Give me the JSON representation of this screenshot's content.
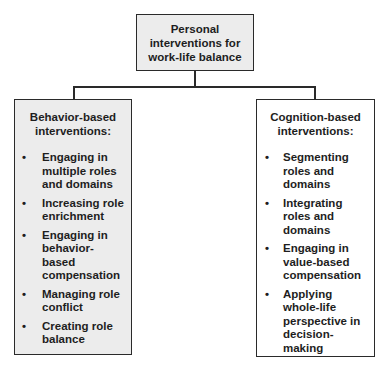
{
  "diagram": {
    "root": {
      "title": "Personal\ninterventions for\nwork-life balance"
    },
    "branches": [
      {
        "heading": "Behavior-based\ninterventions:",
        "items": [
          "Engaging in multiple roles and domains",
          "Increasing role enrichment",
          "Engaging in behavior-based compensation",
          "Managing role conflict",
          "Creating role balance"
        ]
      },
      {
        "heading": "Cognition-based\ninterventions:",
        "items": [
          "Segmenting roles and domains",
          "Integrating roles and domains",
          "Engaging in value-based compensation",
          "Applying whole-life perspective in decision-making"
        ]
      }
    ],
    "bullet": "•",
    "colors": {
      "border": "#2a2a2a",
      "shaded_fill": "#ececec",
      "plain_fill": "#ffffff",
      "text": "#1e1e1e"
    }
  }
}
